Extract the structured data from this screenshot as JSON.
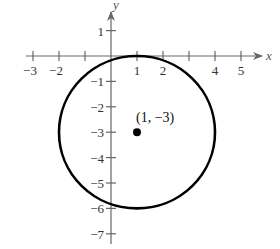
{
  "chart_data": {
    "type": "scatter",
    "title": "",
    "xlabel": "x",
    "ylabel": "y",
    "xlim": [
      -3.2,
      5.5
    ],
    "ylim": [
      -7.5,
      2.0
    ],
    "grid": false,
    "x_ticks": [
      -3,
      -2,
      -1,
      1,
      2,
      3,
      4,
      5
    ],
    "x_tick_labels": [
      "−3",
      "−2",
      "",
      "1",
      "2",
      "",
      "4",
      "5"
    ],
    "y_ticks": [
      1,
      -1,
      -2,
      -3,
      -4,
      -5,
      -6,
      -7
    ],
    "y_tick_labels": [
      "1",
      "−1",
      "−2",
      "−3",
      "−4",
      "−5",
      "−6",
      "−7"
    ],
    "shapes": [
      {
        "type": "circle",
        "center": [
          1,
          -3
        ],
        "radius": 3,
        "equation": "(x - 1)^2 + (y + 3)^2 = 9"
      }
    ],
    "points": [
      {
        "x": 1,
        "y": -3,
        "label": "(1, −3)"
      }
    ]
  },
  "colors": {
    "axis": "#666666",
    "curve": "#000000",
    "point": "#000000",
    "text": "#333333"
  }
}
